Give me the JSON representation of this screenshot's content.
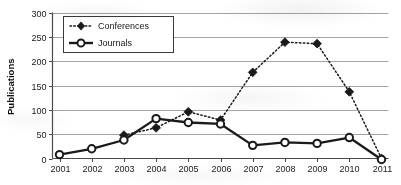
{
  "chart_data": {
    "type": "line",
    "title": "",
    "xlabel": "",
    "ylabel": "Publications",
    "x": [
      2001,
      2002,
      2003,
      2004,
      2005,
      2006,
      2007,
      2008,
      2009,
      2010,
      2011
    ],
    "categories": [
      "2001",
      "2002",
      "2003",
      "2004",
      "2005",
      "2006",
      "2007",
      "2008",
      "2009",
      "2010",
      "2011"
    ],
    "xlim": [
      2001,
      2011
    ],
    "ylim": [
      0,
      300
    ],
    "yticks": [
      0,
      50,
      100,
      150,
      200,
      250,
      300
    ],
    "ytick_labels": [
      "0",
      "50",
      "100",
      "150",
      "200",
      "250",
      "300"
    ],
    "grid": "horizontal",
    "legend_position": "upper-left-inside",
    "series": [
      {
        "name": "Conferences",
        "marker": "filled-diamond",
        "line_style": "dotted",
        "color": "#1a1a1a",
        "values": [
          null,
          null,
          48,
          63,
          96,
          79,
          177,
          239,
          236,
          137,
          0
        ]
      },
      {
        "name": "Journals",
        "marker": "open-circle",
        "line_style": "solid",
        "color": "#1a1a1a",
        "values": [
          8,
          20,
          38,
          82,
          74,
          71,
          27,
          33,
          31,
          43,
          -2
        ]
      }
    ]
  },
  "legend": {
    "entries": [
      {
        "label": "Conferences"
      },
      {
        "label": "Journals"
      }
    ]
  },
  "axes": {
    "y_title": "Publications",
    "y_tick_labels": [
      "300",
      "250",
      "200",
      "150",
      "100",
      "50",
      "0"
    ],
    "x_tick_labels": [
      "2001",
      "2002",
      "2003",
      "2004",
      "2005",
      "2006",
      "2007",
      "2008",
      "2009",
      "2010",
      "2011"
    ]
  },
  "colors": {
    "ink": "#1a1a1a",
    "grid": "#9a9a9a",
    "axis": "#4a4a4a",
    "background": "#ffffff"
  }
}
